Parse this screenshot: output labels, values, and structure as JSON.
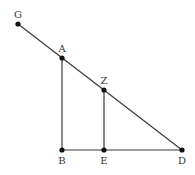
{
  "diagram": {
    "type": "geometry",
    "points": {
      "G": {
        "label": "G",
        "x": 18,
        "y": 24,
        "label_dx": 0,
        "label_dy": -6
      },
      "A": {
        "label": "A",
        "x": 62,
        "y": 58,
        "label_dx": 0,
        "label_dy": -6
      },
      "Z": {
        "label": "Z",
        "x": 104,
        "y": 90,
        "label_dx": 0,
        "label_dy": -6
      },
      "B": {
        "label": "B",
        "x": 62,
        "y": 150,
        "label_dx": 0,
        "label_dy": 14
      },
      "E": {
        "label": "E",
        "x": 104,
        "y": 150,
        "label_dx": 0,
        "label_dy": 14
      },
      "D": {
        "label": "D",
        "x": 182,
        "y": 150,
        "label_dx": 0,
        "label_dy": 14
      }
    },
    "segments": [
      {
        "from": "G",
        "to": "D"
      },
      {
        "from": "A",
        "to": "B"
      },
      {
        "from": "Z",
        "to": "E"
      },
      {
        "from": "B",
        "to": "D"
      }
    ],
    "colors": {
      "line": "#3a3a3a",
      "point": "#111111",
      "label": "#333333",
      "background": "#ffffff"
    }
  }
}
